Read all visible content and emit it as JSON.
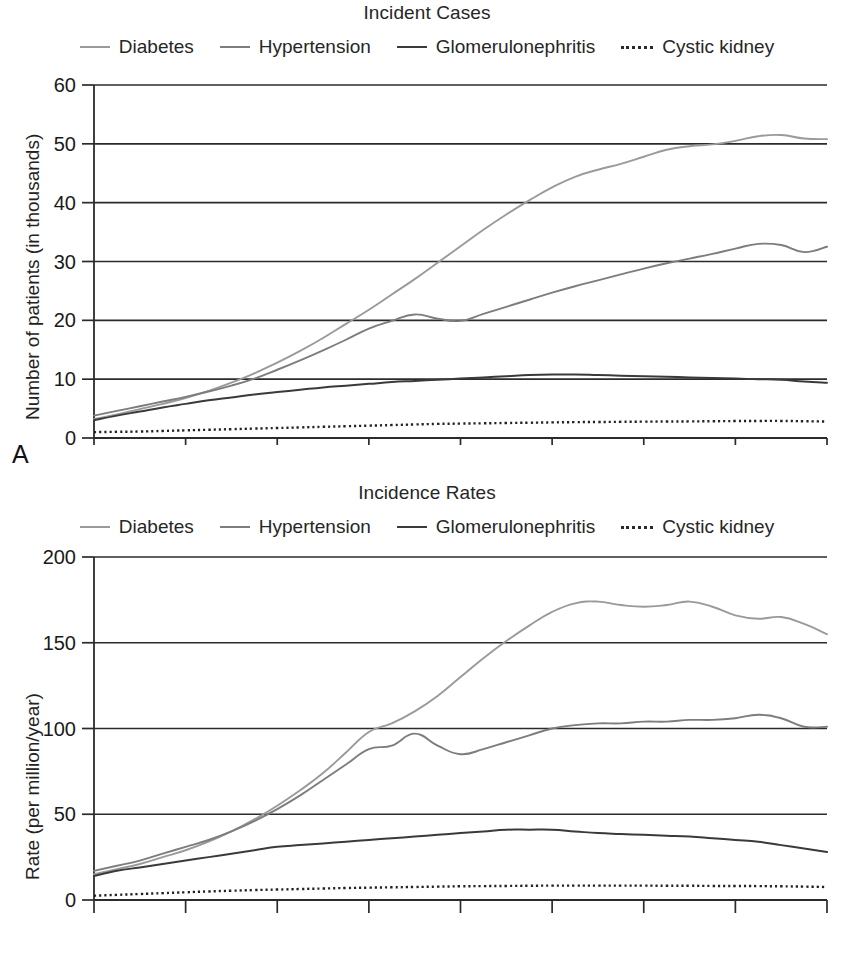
{
  "figure": {
    "panels": [
      {
        "letter": "A",
        "title": "Incident Cases",
        "ylabel": "Number of patients (in thousands)"
      },
      {
        "letter": "B",
        "title": "Incidence Rates",
        "ylabel": "Rate (per million/year)"
      }
    ],
    "legend": [
      {
        "label": "Diabetes",
        "style": "solid-light",
        "color": "#9a9a9a"
      },
      {
        "label": "Hypertension",
        "style": "solid-mid",
        "color": "#7d7d7d"
      },
      {
        "label": "Glomerulonephritis",
        "style": "solid-dark",
        "color": "#3a3a3a"
      },
      {
        "label": "Cystic kidney",
        "style": "dotted",
        "color": "#222222"
      }
    ]
  },
  "chart_data": [
    {
      "type": "line",
      "panel": "A",
      "title": "Incident Cases",
      "xlabel": "",
      "ylabel": "Number of patients (in thousands)",
      "xlim": [
        1980,
        2012
      ],
      "ylim": [
        0,
        60
      ],
      "yticks": [
        0,
        10,
        20,
        30,
        40,
        50,
        60
      ],
      "xticks": [
        1980,
        1984,
        1988,
        1992,
        1996,
        2000,
        2004,
        2008,
        2012
      ],
      "grid": true,
      "legend_position": "top",
      "x": [
        1980,
        1981,
        1982,
        1983,
        1984,
        1985,
        1986,
        1987,
        1988,
        1989,
        1990,
        1991,
        1992,
        1993,
        1994,
        1995,
        1996,
        1997,
        1998,
        1999,
        2000,
        2001,
        2002,
        2003,
        2004,
        2005,
        2006,
        2007,
        2008,
        2009,
        2010,
        2011,
        2012
      ],
      "series": [
        {
          "name": "Diabetes",
          "values": [
            3.2,
            4.0,
            4.9,
            5.8,
            6.8,
            8.0,
            9.4,
            11.0,
            12.8,
            14.8,
            17.0,
            19.4,
            21.8,
            24.4,
            27.0,
            29.8,
            32.6,
            35.4,
            38.0,
            40.4,
            42.6,
            44.4,
            45.6,
            46.6,
            47.8,
            49.0,
            49.6,
            49.9,
            50.5,
            51.3,
            51.5,
            50.9,
            50.8
          ]
        },
        {
          "name": "Hypertension",
          "values": [
            3.8,
            4.6,
            5.4,
            6.2,
            7.0,
            7.9,
            8.9,
            10.1,
            11.6,
            13.2,
            14.9,
            16.7,
            18.6,
            19.9,
            21.0,
            20.3,
            19.9,
            21.1,
            22.3,
            23.5,
            24.7,
            25.8,
            26.8,
            27.8,
            28.8,
            29.7,
            30.5,
            31.3,
            32.2,
            33.0,
            32.8,
            31.6,
            32.5
          ]
        },
        {
          "name": "Glomerulonephritis",
          "values": [
            3.0,
            3.8,
            4.5,
            5.2,
            5.8,
            6.4,
            6.9,
            7.4,
            7.8,
            8.2,
            8.6,
            8.9,
            9.2,
            9.5,
            9.7,
            9.9,
            10.1,
            10.3,
            10.5,
            10.7,
            10.8,
            10.8,
            10.7,
            10.6,
            10.5,
            10.4,
            10.3,
            10.2,
            10.1,
            10.0,
            9.9,
            9.6,
            9.4
          ]
        },
        {
          "name": "Cystic kidney",
          "values": [
            1.0,
            1.05,
            1.1,
            1.2,
            1.3,
            1.4,
            1.5,
            1.6,
            1.7,
            1.8,
            1.9,
            2.0,
            2.1,
            2.2,
            2.3,
            2.4,
            2.45,
            2.5,
            2.55,
            2.6,
            2.65,
            2.7,
            2.72,
            2.75,
            2.78,
            2.8,
            2.82,
            2.85,
            2.88,
            2.9,
            2.9,
            2.85,
            2.8
          ]
        }
      ]
    },
    {
      "type": "line",
      "panel": "B",
      "title": "Incidence Rates",
      "xlabel": "",
      "ylabel": "Rate (per million/year)",
      "xlim": [
        1980,
        2012
      ],
      "ylim": [
        0,
        200
      ],
      "yticks": [
        0,
        50,
        100,
        150,
        200
      ],
      "xticks": [
        1980,
        1984,
        1988,
        1992,
        1996,
        2000,
        2004,
        2008,
        2012
      ],
      "grid": true,
      "legend_position": "top",
      "x": [
        1980,
        1981,
        1982,
        1983,
        1984,
        1985,
        1986,
        1987,
        1988,
        1989,
        1990,
        1991,
        1992,
        1993,
        1994,
        1995,
        1996,
        1997,
        1998,
        1999,
        2000,
        2001,
        2002,
        2003,
        2004,
        2005,
        2006,
        2007,
        2008,
        2009,
        2010,
        2011,
        2012
      ],
      "series": [
        {
          "name": "Diabetes",
          "values": [
            15,
            18,
            21,
            25,
            29,
            34,
            40,
            47,
            55,
            64,
            74,
            86,
            98,
            103,
            110,
            119,
            130,
            141,
            151,
            160,
            168,
            173,
            174,
            172,
            171,
            172,
            174,
            171,
            166,
            164,
            165,
            161,
            155
          ]
        },
        {
          "name": "Hypertension",
          "values": [
            17,
            20,
            23,
            27,
            31,
            35,
            40,
            46,
            53,
            61,
            70,
            79,
            88,
            90,
            97,
            90,
            85,
            88,
            92,
            96,
            100,
            102,
            103,
            103,
            104,
            104,
            105,
            105,
            106,
            108,
            106,
            101,
            101
          ]
        },
        {
          "name": "Glomerulonephritis",
          "values": [
            14,
            17,
            19,
            21,
            23,
            25,
            27,
            29,
            31,
            32,
            33,
            34,
            35,
            36,
            37,
            38,
            39,
            40,
            41,
            41,
            41,
            40,
            39,
            38.5,
            38,
            37.5,
            37,
            36,
            35,
            34,
            32,
            30,
            28
          ]
        },
        {
          "name": "Cystic kidney",
          "values": [
            2.5,
            3.0,
            3.5,
            4.0,
            4.5,
            5.0,
            5.4,
            5.8,
            6.1,
            6.4,
            6.7,
            7.0,
            7.2,
            7.4,
            7.6,
            7.8,
            8.0,
            8.1,
            8.2,
            8.3,
            8.4,
            8.4,
            8.4,
            8.4,
            8.4,
            8.3,
            8.3,
            8.2,
            8.2,
            8.1,
            8.0,
            7.8,
            7.6
          ]
        }
      ]
    }
  ]
}
